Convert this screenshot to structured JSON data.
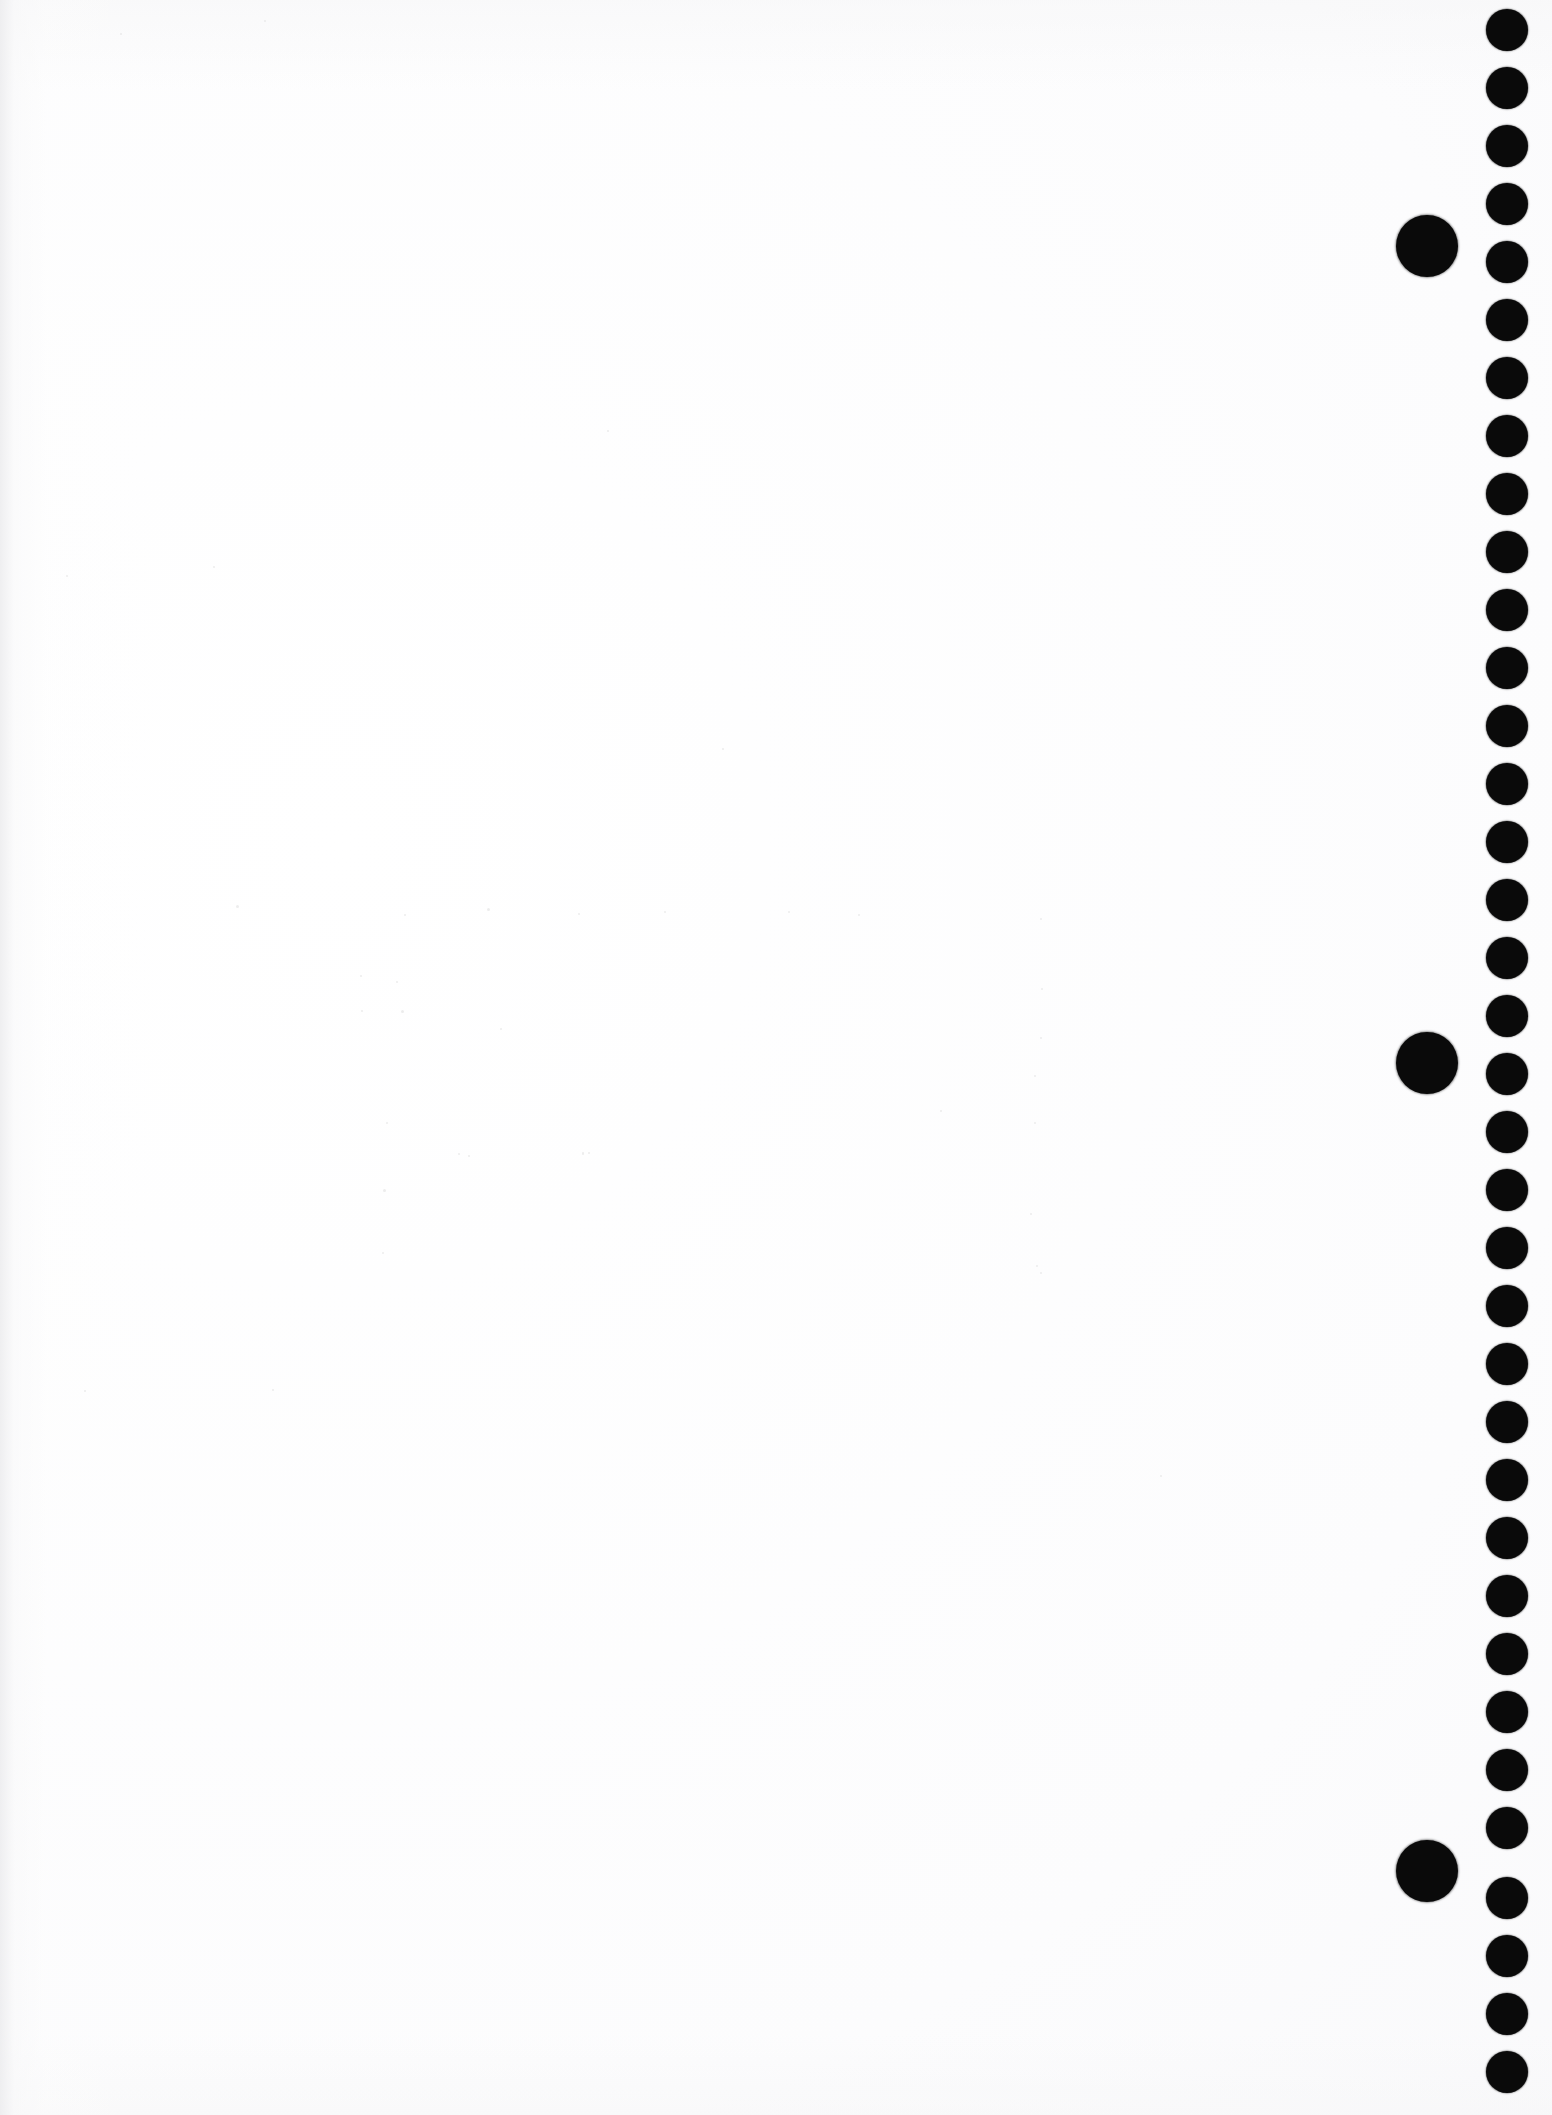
{
  "page": {
    "width": 1552,
    "height": 2115,
    "background_color": "#ffffff",
    "paper_tone": "#fcfcfd",
    "content_text": "",
    "caption": "Blank scanned sheet; right margin carries a vertical column of printed register dots with three larger dots offset to their left."
  },
  "marks": {
    "ink_color": "#0a0a0a",
    "small_dot": {
      "label": "register-dot",
      "diameter": 42,
      "center_x": 1507,
      "first_center_y": 30,
      "spacing_y": 58,
      "count": 36,
      "center_y_values": [
        30,
        88,
        146,
        204,
        262,
        320,
        378,
        436,
        494,
        552,
        610,
        668,
        726,
        784,
        842,
        900,
        958,
        1016,
        1074,
        1132,
        1190,
        1248,
        1306,
        1364,
        1422,
        1480,
        1538,
        1596,
        1654,
        1712,
        1770,
        1828,
        1898,
        1956,
        2014,
        2072
      ]
    },
    "large_dot": {
      "label": "index-dot",
      "diameter": 62,
      "center_x": 1427,
      "count": 3,
      "center_y_values": [
        246,
        1063,
        1871
      ]
    }
  },
  "speckles": {
    "label": "scan-noise",
    "color": "#dedede",
    "points": [
      {
        "x": 236,
        "y": 905,
        "s": 3
      },
      {
        "x": 404,
        "y": 914,
        "s": 2
      },
      {
        "x": 487,
        "y": 908,
        "s": 3
      },
      {
        "x": 578,
        "y": 913,
        "s": 2
      },
      {
        "x": 664,
        "y": 911,
        "s": 2
      },
      {
        "x": 788,
        "y": 911,
        "s": 2
      },
      {
        "x": 858,
        "y": 914,
        "s": 2
      },
      {
        "x": 1040,
        "y": 918,
        "s": 2
      },
      {
        "x": 1041,
        "y": 988,
        "s": 2
      },
      {
        "x": 360,
        "y": 975,
        "s": 2
      },
      {
        "x": 396,
        "y": 981,
        "s": 2
      },
      {
        "x": 361,
        "y": 1010,
        "s": 2
      },
      {
        "x": 401,
        "y": 1010,
        "s": 3
      },
      {
        "x": 1040,
        "y": 1037,
        "s": 2
      },
      {
        "x": 1034,
        "y": 1075,
        "s": 2
      },
      {
        "x": 386,
        "y": 1122,
        "s": 2
      },
      {
        "x": 1034,
        "y": 1122,
        "s": 2
      },
      {
        "x": 458,
        "y": 1153,
        "s": 2
      },
      {
        "x": 468,
        "y": 1155,
        "s": 2
      },
      {
        "x": 582,
        "y": 1152,
        "s": 2
      },
      {
        "x": 582,
        "y": 1153,
        "s": 2
      },
      {
        "x": 588,
        "y": 1152,
        "s": 2
      },
      {
        "x": 383,
        "y": 1189,
        "s": 3
      },
      {
        "x": 1030,
        "y": 1213,
        "s": 2
      },
      {
        "x": 382,
        "y": 1252,
        "s": 2
      },
      {
        "x": 1036,
        "y": 1265,
        "s": 2
      },
      {
        "x": 1040,
        "y": 1272,
        "s": 2
      },
      {
        "x": 607,
        "y": 430,
        "s": 2
      },
      {
        "x": 213,
        "y": 566,
        "s": 2
      },
      {
        "x": 66,
        "y": 575,
        "s": 2
      },
      {
        "x": 722,
        "y": 748,
        "s": 2
      },
      {
        "x": 940,
        "y": 1110,
        "s": 2
      },
      {
        "x": 500,
        "y": 1028,
        "s": 2
      },
      {
        "x": 264,
        "y": 20,
        "s": 2
      },
      {
        "x": 120,
        "y": 33,
        "s": 2
      },
      {
        "x": 84,
        "y": 1390,
        "s": 2
      },
      {
        "x": 272,
        "y": 1389,
        "s": 2
      },
      {
        "x": 1160,
        "y": 1475,
        "s": 2
      }
    ]
  }
}
